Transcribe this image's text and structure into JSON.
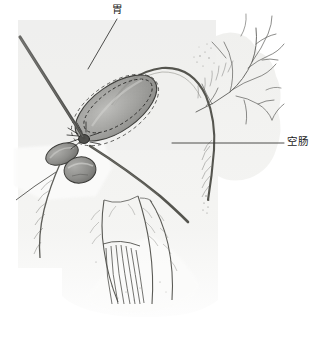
{
  "figure": {
    "type": "anatomical-illustration",
    "style": "stippled pen-and-ink medical drawing",
    "background_color": "#ffffff",
    "panel_color": "#f0f0ee",
    "ink_color": "#4a4a4a",
    "labels": [
      {
        "id": "stomach",
        "text": "胃",
        "x": 112,
        "y": 4,
        "leader": {
          "x1": 117,
          "y1": 19,
          "x2": 88,
          "y2": 69
        }
      },
      {
        "id": "jejunum",
        "text": "空肠",
        "x": 287,
        "y": 136,
        "leader": {
          "x1": 172,
          "y1": 143,
          "x2": 284,
          "y2": 143
        }
      }
    ],
    "structures": [
      {
        "name": "stomach-pouch",
        "description": "stippled ovoid pouch with dashed suture lines"
      },
      {
        "name": "duodenal-lobes",
        "description": "two small bulbous lobes left of pouch"
      },
      {
        "name": "jejunal-loop",
        "description": "long tapering bowel loop crossing diagonally"
      },
      {
        "name": "mesenteric-vessels",
        "description": "branching vascular tree upper right"
      },
      {
        "name": "mesentery-fan",
        "description": "stippled fan of parallel vessel strands below"
      }
    ]
  }
}
